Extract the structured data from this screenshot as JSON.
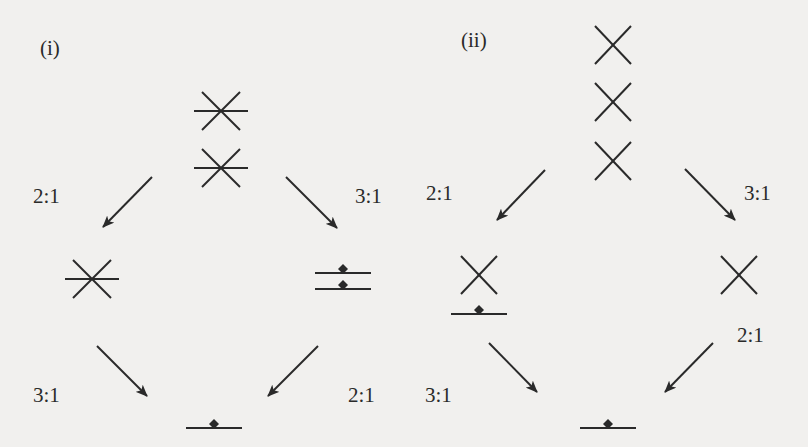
{
  "figure": {
    "panels": [
      {
        "id": "i",
        "label": "(i)",
        "label_pos": [
          40,
          38
        ],
        "nodes": [
          {
            "name": "top-asterisk-upper",
            "type": "asterisk",
            "x": 221,
            "y": 111
          },
          {
            "name": "top-asterisk-lower",
            "type": "asterisk",
            "x": 221,
            "y": 168
          },
          {
            "name": "left-asterisk",
            "type": "asterisk",
            "x": 92,
            "y": 279
          },
          {
            "name": "right-double-line-upper",
            "type": "line-dot",
            "x": 343,
            "y": 273
          },
          {
            "name": "right-double-line-lower",
            "type": "line-dot",
            "x": 343,
            "y": 289
          },
          {
            "name": "bottom-line-dot",
            "type": "line-dot",
            "x": 214,
            "y": 428
          }
        ],
        "arrows": [
          {
            "from": [
              152,
              177
            ],
            "to": [
              103,
              227
            ],
            "ratio": "2:1",
            "ratio_pos": [
              33,
              186
            ]
          },
          {
            "from": [
              286,
              177
            ],
            "to": [
              337,
              228
            ],
            "ratio": "3:1",
            "ratio_pos": [
              355,
              186
            ]
          },
          {
            "from": [
              97,
              346
            ],
            "to": [
              147,
              396
            ],
            "ratio": "3:1",
            "ratio_pos": [
              33,
              385
            ]
          },
          {
            "from": [
              318,
              346
            ],
            "to": [
              268,
              396
            ],
            "ratio": "2:1",
            "ratio_pos": [
              348,
              385
            ]
          }
        ]
      },
      {
        "id": "ii",
        "label": "(ii)",
        "label_pos": [
          461,
          30
        ],
        "nodes": [
          {
            "name": "top-cross-1",
            "type": "cross",
            "x": 613,
            "y": 45
          },
          {
            "name": "top-cross-2",
            "type": "cross",
            "x": 613,
            "y": 102
          },
          {
            "name": "top-cross-3",
            "type": "cross",
            "x": 613,
            "y": 161
          },
          {
            "name": "left-cross",
            "type": "cross",
            "x": 479,
            "y": 275
          },
          {
            "name": "left-line-dot",
            "type": "line-dot",
            "x": 479,
            "y": 314
          },
          {
            "name": "right-cross",
            "type": "cross",
            "x": 739,
            "y": 275
          },
          {
            "name": "bottom-line-dot",
            "type": "line-dot",
            "x": 608,
            "y": 428
          }
        ],
        "arrows": [
          {
            "from": [
              545,
              170
            ],
            "to": [
              497,
              220
            ],
            "ratio": "2:1",
            "ratio_pos": [
              426,
              183
            ]
          },
          {
            "from": [
              685,
              169
            ],
            "to": [
              735,
              220
            ],
            "ratio": "3:1",
            "ratio_pos": [
              744,
              183
            ]
          },
          {
            "from": [
              489,
              343
            ],
            "to": [
              537,
              392
            ],
            "ratio": "3:1",
            "ratio_pos": [
              425,
              385
            ]
          },
          {
            "from": [
              713,
              343
            ],
            "to": [
              665,
              392
            ],
            "ratio": "2:1",
            "ratio_pos": [
              737,
              325
            ]
          }
        ]
      }
    ],
    "colors": {
      "stroke": "#2a2a2a",
      "background": "#f1f0ee"
    }
  }
}
